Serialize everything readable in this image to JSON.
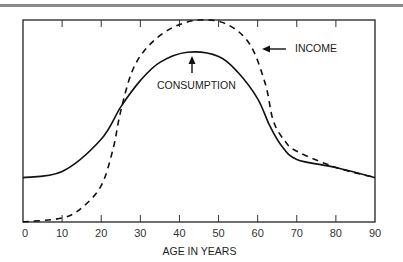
{
  "chart_data": {
    "type": "line",
    "title": "",
    "xlabel": "AGE IN YEARS",
    "ylabel": "",
    "xlim": [
      0,
      90
    ],
    "ylim": [
      0,
      100
    ],
    "x_ticks": [
      0,
      10,
      20,
      30,
      40,
      50,
      60,
      70,
      80,
      90
    ],
    "y_ticks": [],
    "grid": false,
    "legend": "none (inline annotations)",
    "series": [
      {
        "name": "CONSUMPTION",
        "style": "solid",
        "x": [
          0,
          10,
          20,
          25,
          30,
          35,
          42,
          50,
          55,
          60,
          63,
          66,
          70,
          80,
          90
        ],
        "values": [
          22,
          25,
          41,
          57,
          70,
          79,
          84,
          82,
          74,
          61,
          48,
          38,
          31,
          27,
          22
        ]
      },
      {
        "name": "INCOME",
        "style": "dashed",
        "x": [
          0,
          10,
          15,
          20,
          23,
          25,
          28,
          32,
          38,
          45,
          52,
          58,
          62,
          64,
          67,
          70,
          80,
          90
        ],
        "values": [
          0,
          2,
          7,
          18,
          36,
          55,
          75,
          87,
          96,
          100,
          98,
          88,
          68,
          50,
          40,
          35,
          27,
          22
        ]
      }
    ],
    "annotations": [
      {
        "text": "INCOME",
        "arrow": "left",
        "points_to": "income curve near age 61"
      },
      {
        "text": "CONSUMPTION",
        "arrow": "up",
        "points_to": "consumption peak near age 43"
      }
    ]
  },
  "labels": {
    "x_axis": "AGE IN YEARS",
    "income": "INCOME",
    "consumption": "CONSUMPTION",
    "ticks": [
      "0",
      "10",
      "20",
      "30",
      "40",
      "50",
      "60",
      "70",
      "80",
      "90"
    ]
  }
}
